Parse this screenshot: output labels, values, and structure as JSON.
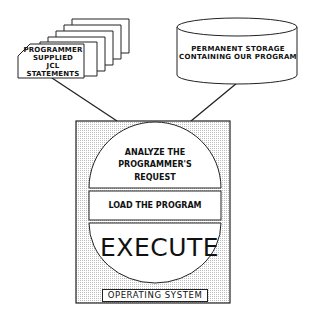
{
  "diagram": {
    "type": "flow",
    "nodes": [
      {
        "id": "jcl",
        "shape": "punched-card-stack",
        "label": "PROGRAMMER SUPPLIED JCL STATEMENTS"
      },
      {
        "id": "storage",
        "shape": "cylinder",
        "label": "PERMANENT STORAGE CONTAINING OUR PROGRAM"
      },
      {
        "id": "os",
        "shape": "shaded-box",
        "label": "OPERATING SYSTEM",
        "children": [
          {
            "id": "analyze",
            "shape": "half-circle-top",
            "label": "ANALYZE THE PROGRAMMER'S REQUEST"
          },
          {
            "id": "load",
            "shape": "rectangle",
            "label": "LOAD THE PROGRAM"
          },
          {
            "id": "execute",
            "shape": "half-circle-bottom",
            "label": "EXECUTE"
          }
        ]
      }
    ],
    "edges": [
      {
        "from": "jcl",
        "to": "os"
      },
      {
        "from": "storage",
        "to": "os"
      }
    ]
  },
  "labels": {
    "cards_line1": "PROGRAMMER",
    "cards_line2": "SUPPLIED",
    "cards_line3": "JCL",
    "cards_line4": "STATEMENTS",
    "storage_line1": "PERMANENT STORAGE",
    "storage_line2": "CONTAINING OUR PROGRAM",
    "analyze_line1": "ANALYZE THE",
    "analyze_line2": "PROGRAMMER'S",
    "analyze_line3": "REQUEST",
    "load": "LOAD THE PROGRAM",
    "execute": "EXECUTE",
    "os": "OPERATING SYSTEM"
  },
  "colors": {
    "stroke": "#222222",
    "shade": "#d9d9d9",
    "fill": "#ffffff"
  }
}
